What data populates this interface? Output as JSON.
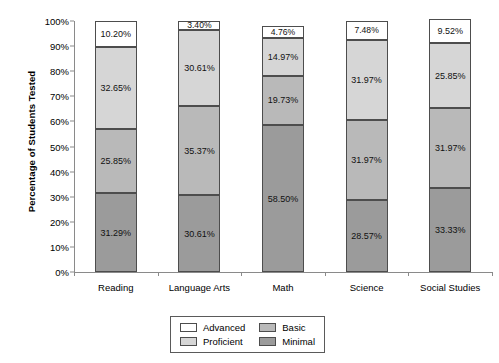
{
  "chart_data": {
    "type": "bar",
    "subtype": "stacked-bar-100",
    "title": "",
    "xlabel": "",
    "ylabel": "Percentage of Students Tested",
    "ylim": [
      0,
      100
    ],
    "grid": false,
    "legend_position": "bottom-center",
    "categories": [
      "Reading",
      "Language Arts",
      "Math",
      "Science",
      "Social Studies"
    ],
    "y_ticks": [
      "0%",
      "10%",
      "20%",
      "30%",
      "40%",
      "50%",
      "60%",
      "70%",
      "80%",
      "90%",
      "100%"
    ],
    "series": [
      {
        "name": "Minimal",
        "color": "#9b9b9b",
        "values": [
          31.29,
          30.61,
          58.5,
          28.57,
          33.33
        ],
        "labels": [
          "31.29%",
          "30.61%",
          "58.50%",
          "28.57%",
          "33.33%"
        ]
      },
      {
        "name": "Basic",
        "color": "#b9b9b9",
        "values": [
          25.85,
          35.37,
          19.73,
          31.97,
          31.97
        ],
        "labels": [
          "25.85%",
          "35.37%",
          "19.73%",
          "31.97%",
          "31.97%"
        ]
      },
      {
        "name": "Proficient",
        "color": "#d6d6d6",
        "values": [
          32.65,
          30.61,
          14.97,
          31.97,
          25.85
        ],
        "labels": [
          "32.65%",
          "30.61%",
          "14.97%",
          "31.97%",
          "25.85%"
        ]
      },
      {
        "name": "Advanced",
        "color": "#ffffff",
        "values": [
          10.2,
          3.4,
          4.76,
          7.48,
          9.52
        ],
        "labels": [
          "10.20%",
          "3.40%",
          "4.76%",
          "7.48%",
          "9.52%"
        ]
      }
    ]
  },
  "legend": {
    "entries": [
      {
        "label": "Advanced",
        "color": "#ffffff"
      },
      {
        "label": "Basic",
        "color": "#b9b9b9"
      },
      {
        "label": "Proficient",
        "color": "#d6d6d6"
      },
      {
        "label": "Minimal",
        "color": "#9b9b9b"
      }
    ]
  },
  "axis": {
    "y_title": "Percentage of Students Tested"
  }
}
